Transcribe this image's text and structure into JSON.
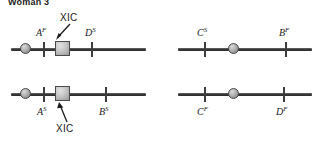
{
  "figure": {
    "title": "Woman 3",
    "colors": {
      "line": "#3a3a3a",
      "centromere_fill": "#b4b4b4",
      "xic_fill": "#c6c6c6",
      "outline": "#4a4a4a",
      "text": "#1a1a1a",
      "background": "#ffffff"
    },
    "chromosomes": [
      {
        "id": "top-left",
        "has_xic": true,
        "xic_label": "XIC",
        "xic_label_position": "above",
        "labels_position": "above",
        "loci": [
          {
            "gene": "A",
            "allele": "F"
          },
          {
            "gene": "D",
            "allele": "S"
          }
        ]
      },
      {
        "id": "top-right",
        "has_xic": false,
        "xic_label": "",
        "xic_label_position": "",
        "labels_position": "above",
        "loci": [
          {
            "gene": "C",
            "allele": "S"
          },
          {
            "gene": "B",
            "allele": "F"
          }
        ]
      },
      {
        "id": "bottom-left",
        "has_xic": true,
        "xic_label": "XIC",
        "xic_label_position": "below",
        "labels_position": "below",
        "loci": [
          {
            "gene": "A",
            "allele": "S"
          },
          {
            "gene": "B",
            "allele": "S"
          }
        ]
      },
      {
        "id": "bottom-right",
        "has_xic": false,
        "xic_label": "",
        "xic_label_position": "",
        "labels_position": "below",
        "loci": [
          {
            "gene": "C",
            "allele": "F"
          },
          {
            "gene": "D",
            "allele": "F"
          }
        ]
      }
    ]
  }
}
